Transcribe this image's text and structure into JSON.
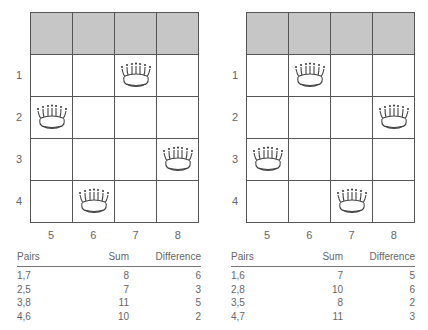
{
  "diagrams": [
    {
      "row_labels": [
        "1",
        "2",
        "3",
        "4"
      ],
      "col_labels": [
        "5",
        "6",
        "7",
        "8"
      ],
      "queens": [
        {
          "row": "1",
          "col": "7"
        },
        {
          "row": "2",
          "col": "5"
        },
        {
          "row": "3",
          "col": "8"
        },
        {
          "row": "4",
          "col": "6"
        }
      ],
      "table": {
        "headers": [
          "Pairs",
          "Sum",
          "Difference"
        ],
        "rows": [
          [
            "1,7",
            "8",
            "6"
          ],
          [
            "2,5",
            "7",
            "3"
          ],
          [
            "3,8",
            "11",
            "5"
          ],
          [
            "4,6",
            "10",
            "2"
          ]
        ]
      }
    },
    {
      "row_labels": [
        "1",
        "2",
        "3",
        "4"
      ],
      "col_labels": [
        "5",
        "6",
        "7",
        "8"
      ],
      "queens": [
        {
          "row": "1",
          "col": "6"
        },
        {
          "row": "2",
          "col": "8"
        },
        {
          "row": "3",
          "col": "5"
        },
        {
          "row": "4",
          "col": "7"
        }
      ],
      "table": {
        "headers": [
          "Pairs",
          "Sum",
          "Difference"
        ],
        "rows": [
          [
            "1,6",
            "7",
            "5"
          ],
          [
            "2,8",
            "10",
            "6"
          ],
          [
            "3,5",
            "8",
            "2"
          ],
          [
            "4,7",
            "11",
            "3"
          ]
        ]
      }
    }
  ],
  "colors": {
    "header_row": "#c6c6c6",
    "grid_line": "#555555",
    "text": "#666666"
  },
  "icons": {
    "queen": "crown-icon"
  }
}
